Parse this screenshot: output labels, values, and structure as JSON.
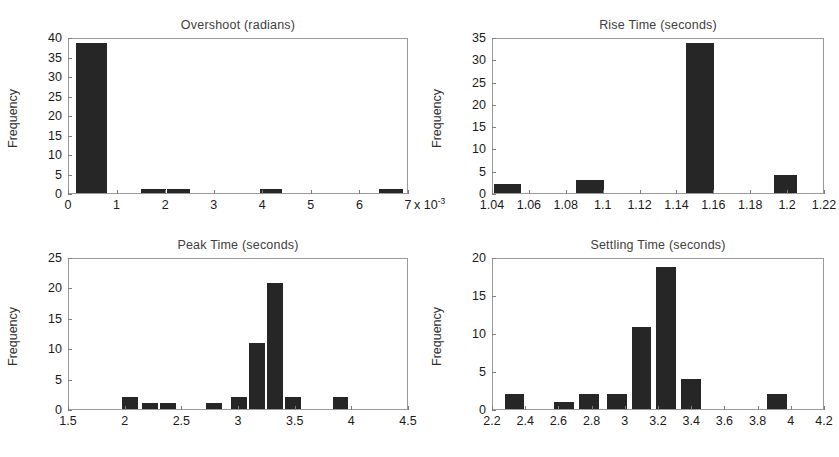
{
  "figure": {
    "background": "#ffffff",
    "bar_color": "#262626",
    "axis_color": "#9a9a9a"
  },
  "chart_data": [
    {
      "id": "overshoot",
      "type": "bar",
      "title": "Overshoot (radians)",
      "xlabel": "",
      "ylabel": "Frequency",
      "x_exponent_label": "x 10",
      "x_exponent_power": "-3",
      "xlim": [
        0,
        7
      ],
      "ylim": [
        0,
        40
      ],
      "xticks": [
        "0",
        "1",
        "2",
        "3",
        "4",
        "5",
        "6",
        "7"
      ],
      "xtick_values": [
        0,
        1,
        2,
        3,
        4,
        5,
        6,
        7
      ],
      "yticks": [
        "0",
        "5",
        "10",
        "15",
        "20",
        "25",
        "30",
        "35",
        "40"
      ],
      "ytick_values": [
        0,
        5,
        10,
        15,
        20,
        25,
        30,
        35,
        40
      ],
      "grid": false,
      "bars": [
        {
          "x0": 0.15,
          "x1": 0.78,
          "value": 39
        },
        {
          "x0": 1.5,
          "x1": 2.0,
          "value": 1
        },
        {
          "x0": 2.02,
          "x1": 2.5,
          "value": 1
        },
        {
          "x0": 3.95,
          "x1": 4.42,
          "value": 1
        },
        {
          "x0": 6.42,
          "x1": 6.92,
          "value": 1
        }
      ]
    },
    {
      "id": "rise-time",
      "type": "bar",
      "title": "Rise Time (seconds)",
      "xlabel": "",
      "ylabel": "Frequency",
      "xlim": [
        1.04,
        1.22
      ],
      "ylim": [
        0,
        35
      ],
      "xticks": [
        "1.04",
        "1.06",
        "1.08",
        "1.1",
        "1.12",
        "1.14",
        "1.16",
        "1.18",
        "1.2",
        "1.22"
      ],
      "xtick_values": [
        1.04,
        1.06,
        1.08,
        1.1,
        1.12,
        1.14,
        1.16,
        1.18,
        1.2,
        1.22
      ],
      "yticks": [
        "0",
        "5",
        "10",
        "15",
        "20",
        "25",
        "30",
        "35"
      ],
      "ytick_values": [
        0,
        5,
        10,
        15,
        20,
        25,
        30,
        35
      ],
      "grid": false,
      "bars": [
        {
          "x0": 1.0405,
          "x1": 1.0555,
          "value": 2
        },
        {
          "x0": 1.0855,
          "x1": 1.1005,
          "value": 3
        },
        {
          "x0": 1.1455,
          "x1": 1.1605,
          "value": 34
        },
        {
          "x0": 1.193,
          "x1": 1.206,
          "value": 4
        }
      ]
    },
    {
      "id": "peak-time",
      "type": "bar",
      "title": "Peak Time (seconds)",
      "xlabel": "",
      "ylabel": "Frequency",
      "xlim": [
        1.5,
        4.5
      ],
      "ylim": [
        0,
        25
      ],
      "xticks": [
        "1.5",
        "2",
        "2.5",
        "3",
        "3.5",
        "4",
        "4.5"
      ],
      "xtick_values": [
        1.5,
        2.0,
        2.5,
        3.0,
        3.5,
        4.0,
        4.5
      ],
      "yticks": [
        "0",
        "5",
        "10",
        "15",
        "20",
        "25"
      ],
      "ytick_values": [
        0,
        5,
        10,
        15,
        20,
        25
      ],
      "grid": false,
      "bars": [
        {
          "x0": 1.97,
          "x1": 2.11,
          "value": 2
        },
        {
          "x0": 2.15,
          "x1": 2.29,
          "value": 1
        },
        {
          "x0": 2.31,
          "x1": 2.45,
          "value": 1
        },
        {
          "x0": 2.72,
          "x1": 2.86,
          "value": 1
        },
        {
          "x0": 2.94,
          "x1": 3.08,
          "value": 2
        },
        {
          "x0": 3.1,
          "x1": 3.24,
          "value": 11
        },
        {
          "x0": 3.26,
          "x1": 3.4,
          "value": 21
        },
        {
          "x0": 3.42,
          "x1": 3.56,
          "value": 2
        },
        {
          "x0": 3.84,
          "x1": 3.98,
          "value": 2
        }
      ]
    },
    {
      "id": "settling-time",
      "type": "bar",
      "title": "Settling Time (seconds)",
      "xlabel": "",
      "ylabel": "Frequency",
      "xlim": [
        2.2,
        4.2
      ],
      "ylim": [
        0,
        20
      ],
      "xticks": [
        "2.2",
        "2.4",
        "2.6",
        "2.8",
        "3",
        "3.2",
        "3.4",
        "3.6",
        "3.8",
        "4",
        "4.2"
      ],
      "xtick_values": [
        2.2,
        2.4,
        2.6,
        2.8,
        3.0,
        3.2,
        3.4,
        3.6,
        3.8,
        4.0,
        4.2
      ],
      "yticks": [
        "0",
        "5",
        "10",
        "15",
        "20"
      ],
      "ytick_values": [
        0,
        5,
        10,
        15,
        20
      ],
      "grid": false,
      "bars": [
        {
          "x0": 2.27,
          "x1": 2.39,
          "value": 2
        },
        {
          "x0": 2.57,
          "x1": 2.69,
          "value": 1
        },
        {
          "x0": 2.72,
          "x1": 2.84,
          "value": 2
        },
        {
          "x0": 2.89,
          "x1": 3.01,
          "value": 2
        },
        {
          "x0": 3.04,
          "x1": 3.16,
          "value": 11
        },
        {
          "x0": 3.19,
          "x1": 3.31,
          "value": 19
        },
        {
          "x0": 3.34,
          "x1": 3.46,
          "value": 4
        },
        {
          "x0": 3.86,
          "x1": 3.98,
          "value": 2
        }
      ]
    }
  ],
  "panel_layout": [
    {
      "id": "overshoot",
      "left": 14,
      "top": 18,
      "box_left": 68,
      "box_top": 38,
      "box_width": 340,
      "box_height": 156
    },
    {
      "id": "rise-time",
      "left": 440,
      "top": 18,
      "box_left": 492,
      "box_top": 38,
      "box_width": 332,
      "box_height": 156
    },
    {
      "id": "peak-time",
      "left": 14,
      "top": 238,
      "box_left": 68,
      "box_top": 258,
      "box_width": 340,
      "box_height": 152
    },
    {
      "id": "settling-time",
      "left": 440,
      "top": 238,
      "box_left": 492,
      "box_top": 258,
      "box_width": 332,
      "box_height": 152
    }
  ]
}
